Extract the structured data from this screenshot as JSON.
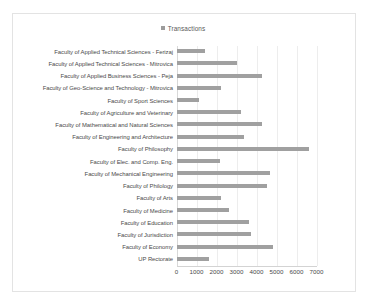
{
  "chart_data": {
    "type": "bar",
    "orientation": "horizontal",
    "title": "",
    "legend": [
      "Transactions"
    ],
    "legend_position": "top-center",
    "series_name": "Transactions",
    "xlabel": "",
    "ylabel": "",
    "xlim": [
      0,
      7000
    ],
    "xticks": [
      0,
      1000,
      2000,
      3000,
      4000,
      5000,
      6000,
      7000
    ],
    "tick_labels": [
      "0",
      "1000",
      "2000",
      "3000",
      "4000",
      "5000",
      "6000",
      "7000"
    ],
    "grid": true,
    "bar_color": "#a0a0a0",
    "categories": [
      "Faculty of Applied Technical Sciences - Ferizaj",
      "Faculty of Applied Technical Sciences - Mitrovica",
      "Faculty of Applied Business Sciences - Peja",
      "Faculty of Geo-Science and Technology - Mitrovica",
      "Faculty of Sport Sciences",
      "Faculty of Agriculture and Veterinary",
      "Faculty of Mathematical and Natural Sciences",
      "Faculty of Engineering and Architecture",
      "Faculty of Philosophy",
      "Faculty of Elec. and Comp. Eng.",
      "Faculty of Mechanical Engineering",
      "Faculty of Philology",
      "Faculty of Arts",
      "Faculty of Medicine",
      "Faculty of Education",
      "Faculty of Jurisdiction",
      "Faculty of Economy",
      "UP Rectorate"
    ],
    "values": [
      1400,
      3000,
      4250,
      2200,
      1100,
      3200,
      4250,
      3350,
      6600,
      2150,
      4650,
      4500,
      2200,
      2600,
      3600,
      3700,
      4800,
      1600
    ]
  }
}
